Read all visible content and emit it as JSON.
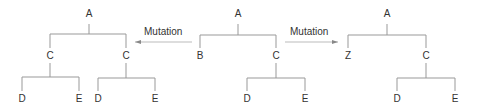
{
  "diagram": {
    "trees": [
      {
        "name": "left-tree",
        "nodes": [
          {
            "label": "A",
            "x": 89,
            "y": 12
          },
          {
            "label": "C",
            "x": 50,
            "y": 53
          },
          {
            "label": "C",
            "x": 126,
            "y": 53
          },
          {
            "label": "D",
            "x": 22,
            "y": 95
          },
          {
            "label": "E",
            "x": 79,
            "y": 95
          },
          {
            "label": "D",
            "x": 98,
            "y": 95
          },
          {
            "label": "E",
            "x": 155,
            "y": 95
          }
        ]
      },
      {
        "name": "middle-tree",
        "nodes": [
          {
            "label": "A",
            "x": 238,
            "y": 12
          },
          {
            "label": "B",
            "x": 200,
            "y": 53
          },
          {
            "label": "C",
            "x": 276,
            "y": 53
          },
          {
            "label": "D",
            "x": 247,
            "y": 95
          },
          {
            "label": "E",
            "x": 305,
            "y": 95
          }
        ]
      },
      {
        "name": "right-tree",
        "nodes": [
          {
            "label": "A",
            "x": 387,
            "y": 12
          },
          {
            "label": "Z",
            "x": 348,
            "y": 53
          },
          {
            "label": "C",
            "x": 426,
            "y": 53
          },
          {
            "label": "D",
            "x": 397,
            "y": 95
          },
          {
            "label": "E",
            "x": 455,
            "y": 95
          }
        ]
      }
    ],
    "arrows": [
      {
        "label": "Mutation",
        "direction": "left"
      },
      {
        "label": "Mutation",
        "direction": "right"
      }
    ]
  }
}
